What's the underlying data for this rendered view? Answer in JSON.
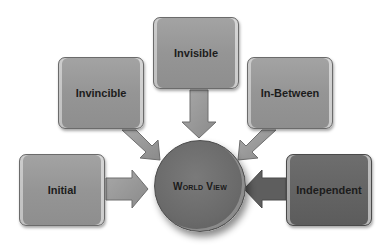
{
  "diagram": {
    "center": {
      "label": "World View",
      "color": "#6e6e6e"
    },
    "nodes": [
      {
        "id": "initial",
        "label": "Initial",
        "color": "#999999"
      },
      {
        "id": "invincible",
        "label": "Invincible",
        "color": "#999999"
      },
      {
        "id": "invisible",
        "label": "Invisible",
        "color": "#999999"
      },
      {
        "id": "in-between",
        "label": "In-Between",
        "color": "#999999"
      },
      {
        "id": "independent",
        "label": "Independent",
        "color": "#666666"
      }
    ],
    "edges": [
      {
        "from": "initial",
        "to": "world-view"
      },
      {
        "from": "invincible",
        "to": "world-view"
      },
      {
        "from": "invisible",
        "to": "world-view"
      },
      {
        "from": "in-between",
        "to": "world-view"
      },
      {
        "from": "independent",
        "to": "world-view"
      }
    ]
  }
}
